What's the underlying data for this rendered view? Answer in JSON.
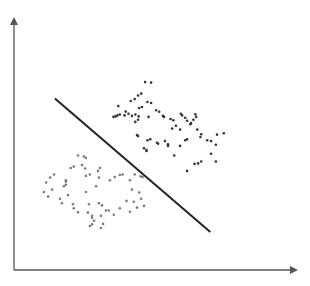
{
  "chart_data": {
    "type": "scatter",
    "title": "",
    "xlabel": "",
    "ylabel": "",
    "xlim": [
      0,
      100
    ],
    "ylim": [
      0,
      100
    ],
    "grid": false,
    "legend": "none",
    "colors": {
      "axis": "#555555",
      "separator": "#222222",
      "class_a": "#333333",
      "class_b": "#7a7a7a"
    },
    "separator": {
      "x": [
        14.5,
        69.6
      ],
      "y": [
        71.5,
        15.8
      ]
    },
    "series": [
      {
        "name": "class-a",
        "points": [
          [
            46.5,
            78.3
          ],
          [
            48.6,
            78.1
          ],
          [
            45.1,
            73.5
          ],
          [
            44.0,
            72.7
          ],
          [
            41.4,
            70.4
          ],
          [
            42.8,
            71.2
          ],
          [
            39.6,
            66.0
          ],
          [
            37.0,
            68.3
          ],
          [
            47.3,
            70.0
          ],
          [
            48.6,
            69.6
          ],
          [
            44.4,
            67.5
          ],
          [
            45.4,
            67.9
          ],
          [
            35.3,
            63.8
          ],
          [
            36.0,
            64.0
          ],
          [
            36.7,
            64.4
          ],
          [
            37.5,
            64.8
          ],
          [
            39.2,
            64.4
          ],
          [
            40.6,
            65.1
          ],
          [
            41.8,
            64.2
          ],
          [
            43.0,
            64.8
          ],
          [
            44.2,
            64.0
          ],
          [
            44.0,
            62.6
          ],
          [
            47.7,
            63.8
          ],
          [
            43.0,
            61.7
          ],
          [
            50.4,
            66.6
          ],
          [
            51.5,
            65.9
          ],
          [
            52.8,
            64.2
          ],
          [
            53.2,
            63.8
          ],
          [
            55.5,
            62.9
          ],
          [
            56.5,
            62.4
          ],
          [
            59.2,
            65.1
          ],
          [
            59.6,
            64.4
          ],
          [
            60.7,
            63.4
          ],
          [
            61.4,
            62.2
          ],
          [
            62.8,
            61.2
          ],
          [
            62.5,
            60.7
          ],
          [
            63.6,
            62.6
          ],
          [
            64.6,
            63.8
          ],
          [
            64.3,
            64.9
          ],
          [
            57.4,
            60.1
          ],
          [
            56.1,
            58.9
          ],
          [
            58.9,
            58.5
          ],
          [
            65.0,
            58.5
          ],
          [
            60.7,
            54.1
          ],
          [
            61.4,
            54.5
          ],
          [
            66.1,
            55.4
          ],
          [
            66.4,
            56.6
          ],
          [
            47.3,
            54.1
          ],
          [
            48.3,
            54.5
          ],
          [
            44.0,
            55.8
          ],
          [
            43.6,
            56.2
          ],
          [
            50.7,
            53.0
          ],
          [
            51.1,
            52.6
          ],
          [
            53.5,
            53.7
          ],
          [
            54.6,
            51.7
          ],
          [
            54.6,
            52.4
          ],
          [
            46.1,
            50.7
          ],
          [
            47.0,
            49.6
          ],
          [
            47.0,
            50.0
          ],
          [
            58.9,
            51.7
          ],
          [
            56.8,
            47.7
          ],
          [
            68.5,
            54.1
          ],
          [
            69.9,
            53.7
          ],
          [
            71.6,
            52.2
          ],
          [
            72.0,
            56.4
          ],
          [
            74.4,
            57.0
          ],
          [
            69.9,
            48.4
          ],
          [
            66.4,
            45.2
          ],
          [
            65.3,
            44.4
          ],
          [
            64.0,
            44.2
          ],
          [
            61.4,
            41.3
          ],
          [
            71.6,
            45.2
          ]
        ]
      },
      {
        "name": "class-b",
        "points": [
          [
            22.7,
            47.7
          ],
          [
            24.8,
            47.3
          ],
          [
            25.5,
            46.7
          ],
          [
            20.1,
            42.5
          ],
          [
            21.2,
            43.1
          ],
          [
            24.1,
            43.7
          ],
          [
            25.2,
            42.3
          ],
          [
            12.8,
            38.5
          ],
          [
            14.2,
            39.8
          ],
          [
            17.7,
            34.9
          ],
          [
            18.4,
            37.4
          ],
          [
            18.4,
            36.8
          ],
          [
            18.4,
            35.5
          ],
          [
            25.5,
            39.2
          ],
          [
            26.9,
            39.8
          ],
          [
            11.4,
            36.4
          ],
          [
            10.6,
            32.5
          ],
          [
            13.5,
            33.5
          ],
          [
            12.1,
            30.6
          ],
          [
            16.3,
            29.7
          ],
          [
            19.1,
            31.2
          ],
          [
            17.0,
            27.8
          ],
          [
            20.9,
            27.4
          ],
          [
            21.2,
            25.7
          ],
          [
            22.7,
            24.1
          ],
          [
            25.5,
            32.5
          ],
          [
            26.6,
            27.4
          ],
          [
            26.2,
            23.9
          ],
          [
            27.7,
            22.6
          ],
          [
            27.7,
            21.8
          ],
          [
            28.4,
            20.5
          ],
          [
            30.1,
            27.8
          ],
          [
            31.2,
            26.9
          ],
          [
            30.8,
            22.6
          ],
          [
            32.6,
            24.8
          ],
          [
            33.6,
            24.8
          ],
          [
            31.6,
            19.2
          ],
          [
            30.8,
            17.5
          ],
          [
            29.1,
            34.9
          ],
          [
            30.1,
            38.5
          ],
          [
            29.8,
            41.3
          ],
          [
            30.5,
            42.5
          ],
          [
            34.0,
            37.4
          ],
          [
            35.7,
            38.7
          ],
          [
            37.5,
            39.6
          ],
          [
            38.5,
            39.8
          ],
          [
            41.1,
            37.4
          ],
          [
            42.8,
            39.8
          ],
          [
            44.9,
            39.0
          ],
          [
            45.6,
            38.7
          ],
          [
            41.8,
            33.5
          ],
          [
            44.4,
            32.3
          ],
          [
            42.5,
            28.4
          ],
          [
            43.6,
            26.0
          ],
          [
            45.1,
            29.7
          ],
          [
            46.1,
            26.7
          ],
          [
            39.9,
            28.8
          ],
          [
            41.1,
            24.3
          ],
          [
            35.4,
            23.0
          ],
          [
            37.5,
            25.7
          ],
          [
            26.9,
            18.3
          ],
          [
            27.7,
            19.0
          ]
        ]
      }
    ]
  }
}
